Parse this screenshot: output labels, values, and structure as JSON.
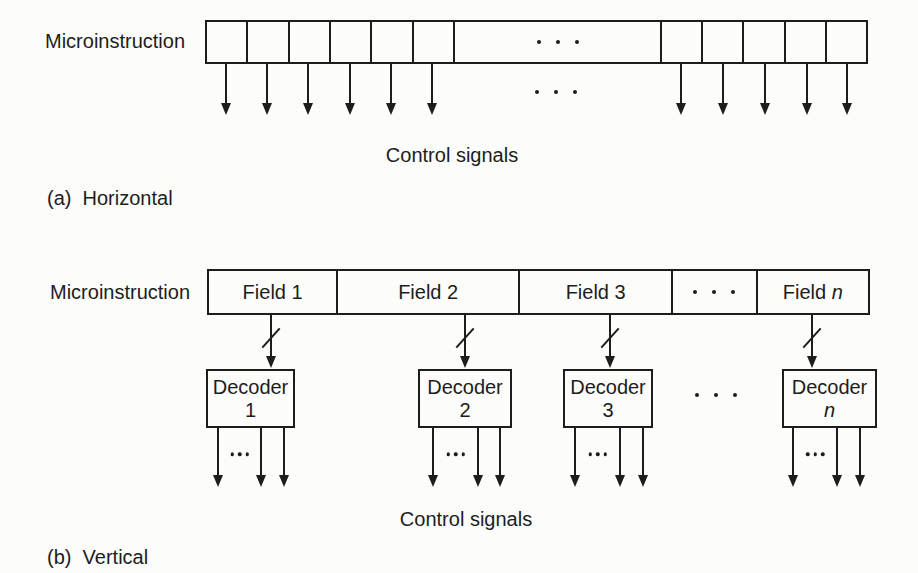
{
  "colors": {
    "background": "#fcfcfa",
    "ink": "#1d1d1d"
  },
  "section_a": {
    "microinstruction_label": "Microinstruction",
    "control_signals_label": "Control signals",
    "caption": "(a)  Horizontal",
    "ellipsis": "· · ·",
    "geometry": {
      "label_pos": {
        "x": 45,
        "y": 30
      },
      "bar": {
        "x": 205,
        "y": 20,
        "width": 663,
        "height": 44
      },
      "left_cells": 6,
      "right_cells": 5,
      "left_group_width": 248,
      "right_group_width": 206,
      "arrow_xs": [
        226,
        267,
        308,
        350,
        391,
        432,
        681,
        723,
        765,
        807,
        847
      ],
      "arrow_top": 64,
      "arrow_bottom": 115,
      "row_dots": {
        "x": 556,
        "y": 92
      },
      "control_signals_pos": {
        "x": 452,
        "y": 144
      },
      "caption_pos": {
        "x": 47,
        "y": 187
      }
    }
  },
  "section_b": {
    "microinstruction_label": "Microinstruction",
    "control_signals_label": "Control signals",
    "caption": "(b)  Vertical",
    "ellipsis": "· · ·",
    "decoder_out_dots": "...",
    "fields": [
      {
        "text": "Field 1",
        "width": 128,
        "arrow_x": 271
      },
      {
        "text": "Field 2",
        "width": 183,
        "arrow_x": 465
      },
      {
        "text": "Field 3",
        "width": 154,
        "arrow_x": 610
      },
      {
        "text": "· · ·",
        "width": 85,
        "is_ellipsis": true
      },
      {
        "text": "Field",
        "suffix": "n",
        "width": 113,
        "arrow_x": 812
      }
    ],
    "decoders": [
      {
        "line1": "Decoder",
        "line2": "1",
        "x": 206,
        "width": 89,
        "arrow_xs": [
          218,
          261,
          284
        ]
      },
      {
        "line1": "Decoder",
        "line2": "2",
        "x": 418,
        "width": 94,
        "arrow_xs": [
          433,
          478,
          500
        ]
      },
      {
        "line1": "Decoder",
        "line2": "3",
        "x": 563,
        "width": 90,
        "arrow_xs": [
          575,
          620,
          643
        ]
      },
      {
        "line1": "Decoder",
        "line2": "n",
        "italic": true,
        "x": 782,
        "width": 95,
        "arrow_xs": [
          793,
          837,
          860
        ]
      }
    ],
    "geometry": {
      "label_pos": {
        "x": 50,
        "y": 281
      },
      "bar": {
        "x": 207,
        "y": 269,
        "width": 663,
        "height": 46
      },
      "field_arrow_top": 315,
      "field_arrow_bottom": 368,
      "slash_y": 338,
      "decoder_top": 369,
      "decoder_height": 59,
      "out_arrow_top": 428,
      "out_arrow_bottom": 487,
      "decoder_ellipsis_pos": {
        "x": 716,
        "y": 395
      },
      "out_dots_y": 454,
      "control_signals_pos": {
        "x": 466,
        "y": 508
      },
      "caption_pos": {
        "x": 47,
        "y": 546
      }
    }
  }
}
